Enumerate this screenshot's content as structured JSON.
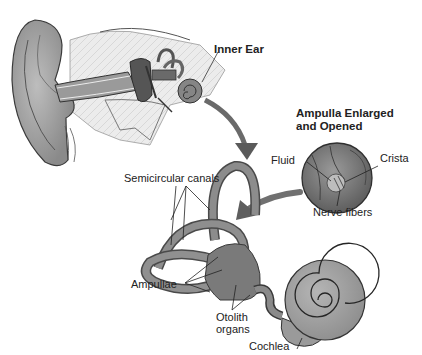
{
  "diagram": {
    "title_labels": {
      "inner_ear": "Inner Ear",
      "ampulla_heading_line1": "Ampulla Enlarged",
      "ampulla_heading_line2": "and Opened"
    },
    "ampulla_labels": {
      "fluid": "Fluid",
      "crista": "Crista",
      "nerve_fibers": "Nerve fibers"
    },
    "labyrinth_labels": {
      "semicircular_canals": "Semicircular canals",
      "ampullae": "Ampullae",
      "otolith_line1": "Otolith",
      "otolith_line2": "organs",
      "cochlea": "Cochlea"
    },
    "colors": {
      "background": "#ffffff",
      "tissue_dark": "#6e6e6e",
      "tissue_mid": "#8c8c8c",
      "tissue_light": "#c8c8c8",
      "bone": "#e4e4e4",
      "outline": "#333333",
      "text": "#222222"
    }
  }
}
